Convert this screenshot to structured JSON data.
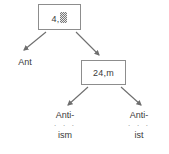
{
  "diagram": {
    "type": "tree",
    "title": "",
    "background_color": "#ffffff",
    "text_color": "#3a3a3a",
    "box_border_color": "#8d8d8d",
    "arrow_color": "#6e6e6e",
    "nodes": [
      {
        "id": "root",
        "shape": "box",
        "label_prefix": "4,",
        "label_glyph": "redacted-block-glyph",
        "label_full": "4,▓"
      },
      {
        "id": "inner",
        "shape": "box",
        "label": "24,m"
      },
      {
        "id": "leaf-ant",
        "shape": "text",
        "label": "Ant"
      },
      {
        "id": "leaf-ism",
        "shape": "text",
        "label_top": "Anti-",
        "label_dots": "· · ·",
        "label_bottom": "ism"
      },
      {
        "id": "leaf-ist",
        "shape": "text",
        "label_top": "Anti-",
        "label_dots": "· · ·",
        "label_bottom": "ist"
      }
    ],
    "edges": [
      {
        "from": "root",
        "to": "leaf-ant",
        "style": "arrow"
      },
      {
        "from": "root",
        "to": "inner",
        "style": "arrow"
      },
      {
        "from": "inner",
        "to": "leaf-ism",
        "style": "arrow"
      },
      {
        "from": "inner",
        "to": "leaf-ist",
        "style": "arrow"
      }
    ]
  }
}
